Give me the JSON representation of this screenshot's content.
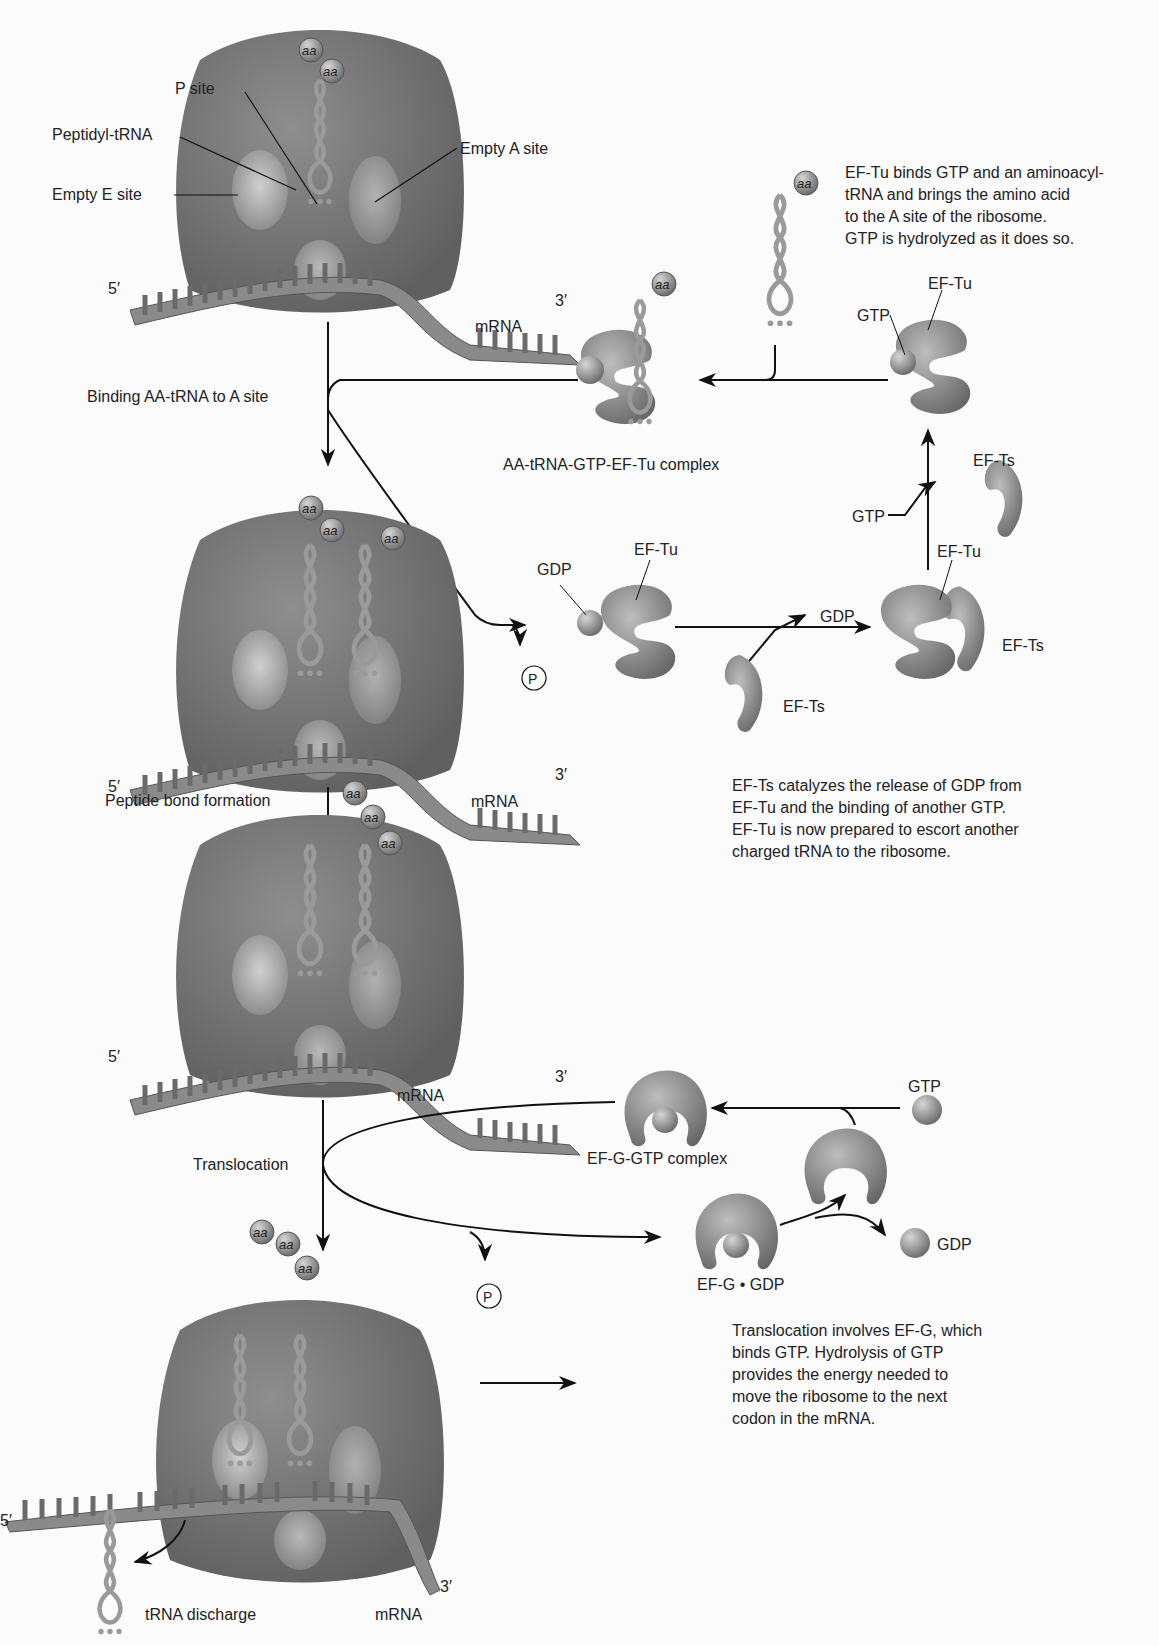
{
  "figure": {
    "ribosome_1": {
      "labels": {
        "p_site": "P site",
        "peptidyl_trna": "Peptidyl-tRNA",
        "empty_a_site": "Empty A site",
        "empty_e_site": "Empty E site",
        "five_prime": "5′",
        "three_prime": "3′",
        "mrna": "mRNA"
      },
      "amino_acids": [
        "aa",
        "aa"
      ]
    },
    "steps": {
      "binding": "Binding AA-tRNA to A site",
      "peptide_bond": "Peptide bond formation",
      "translocation": "Translocation"
    },
    "ef_tu_cycle": {
      "note_top": "EF-Tu binds GTP and an aminoacyl-\ntRNA and brings the amino acid\nto the A site of the ribosome.\nGTP is hydrolyzed as it does so.",
      "complex_label": "AA-tRNA-GTP-EF-Tu complex",
      "free_trna_aa": "aa",
      "complex_aa": "aa",
      "ef_tu_gtp": {
        "gtp": "GTP",
        "ef_tu": "EF-Tu"
      },
      "ef_tu_gdp": {
        "gdp": "GDP",
        "ef_tu": "EF-Tu"
      },
      "phosphate": "P",
      "ef_ts_free": "EF-Ts",
      "gdp_release": "GDP",
      "ef_tu_ts_complex": {
        "ef_tu": "EF-Tu",
        "ef_ts": "EF-Ts"
      },
      "gtp_in": "GTP",
      "ef_ts_released": "EF-Ts",
      "note_bottom": "EF-Ts catalyzes the release of GDP from\nEF-Tu and the binding of another GTP.\nEF-Tu is now prepared to escort another\ncharged tRNA to the ribosome."
    },
    "ribosome_2": {
      "labels": {
        "five_prime": "5′",
        "three_prime": "3′",
        "mrna": "mRNA"
      },
      "amino_acids": [
        "aa",
        "aa",
        "aa"
      ]
    },
    "ribosome_3": {
      "labels": {
        "five_prime": "5′",
        "three_prime": "3′",
        "mrna": "mRNA"
      },
      "amino_acids": [
        "aa",
        "aa",
        "aa"
      ]
    },
    "ef_g_cycle": {
      "complex_label": "EF-G-GTP complex",
      "gtp": "GTP",
      "ef_g_gdp": "EF-G • GDP",
      "gdp": "GDP",
      "phosphate": "P",
      "note": "Translocation involves EF-G, which\nbinds GTP. Hydrolysis of GTP\nprovides the energy needed to\nmove the ribosome to the next\ncodon in the mRNA."
    },
    "ribosome_4": {
      "labels": {
        "five_prime": "5′",
        "three_prime": "3′",
        "mrna": "mRNA",
        "trna_discharge": "tRNA discharge"
      },
      "amino_acids": [
        "aa",
        "aa",
        "aa"
      ]
    },
    "colors": {
      "ribosome": "#7d7d7d",
      "ribosome_dark": "#5f5f5f",
      "mrna": "#8a8a8a",
      "protein": "#8c8c8c",
      "sphere": "#9a9a9a",
      "line": "#111111",
      "background": "#fbfbfb"
    }
  }
}
